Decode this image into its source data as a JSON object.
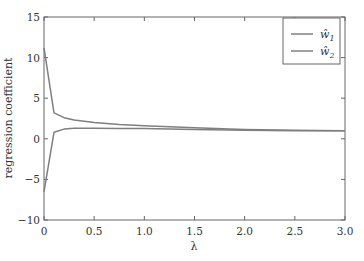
{
  "chart_data": {
    "type": "line",
    "title": "",
    "xlabel": "λ",
    "ylabel": "regression coefficient",
    "xlim": [
      0,
      3.0
    ],
    "ylim": [
      -10,
      15
    ],
    "grid": false,
    "legend_position": "upper right",
    "x_ticks": [
      "0",
      "0.5",
      "1.0",
      "1.5",
      "2.0",
      "2.5",
      "3.0"
    ],
    "y_ticks": [
      "-10",
      "-5",
      "0",
      "5",
      "10",
      "15"
    ],
    "x": [
      0,
      0.1,
      0.2,
      0.3,
      0.5,
      0.75,
      1.0,
      1.5,
      2.0,
      2.5,
      3.0
    ],
    "series": [
      {
        "name": "ŵ1",
        "color": "#7f7f7f",
        "values": [
          11.2,
          3.2,
          2.6,
          2.3,
          2.0,
          1.75,
          1.6,
          1.35,
          1.15,
          1.05,
          1.0
        ]
      },
      {
        "name": "ŵ2",
        "color": "#7f7f7f",
        "values": [
          -6.5,
          0.8,
          1.2,
          1.3,
          1.3,
          1.28,
          1.25,
          1.15,
          1.05,
          1.0,
          0.98
        ]
      }
    ]
  },
  "axes": {
    "xlabel": "λ",
    "ylabel": "regression coefficient"
  },
  "legend": {
    "items": [
      {
        "label": "ŵ",
        "sub": "1"
      },
      {
        "label": "ŵ",
        "sub": "2"
      }
    ]
  }
}
